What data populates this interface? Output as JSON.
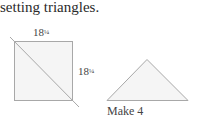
{
  "heading": "setting triangles.",
  "square": {
    "top_label": "18",
    "top_label_fraction": "¼",
    "side_label": "18",
    "side_label_fraction": "¼"
  },
  "triangle": {
    "caption": "Make 4"
  },
  "colors": {
    "stroke": "#a8a8a8",
    "fill": "#f5f5f5"
  }
}
